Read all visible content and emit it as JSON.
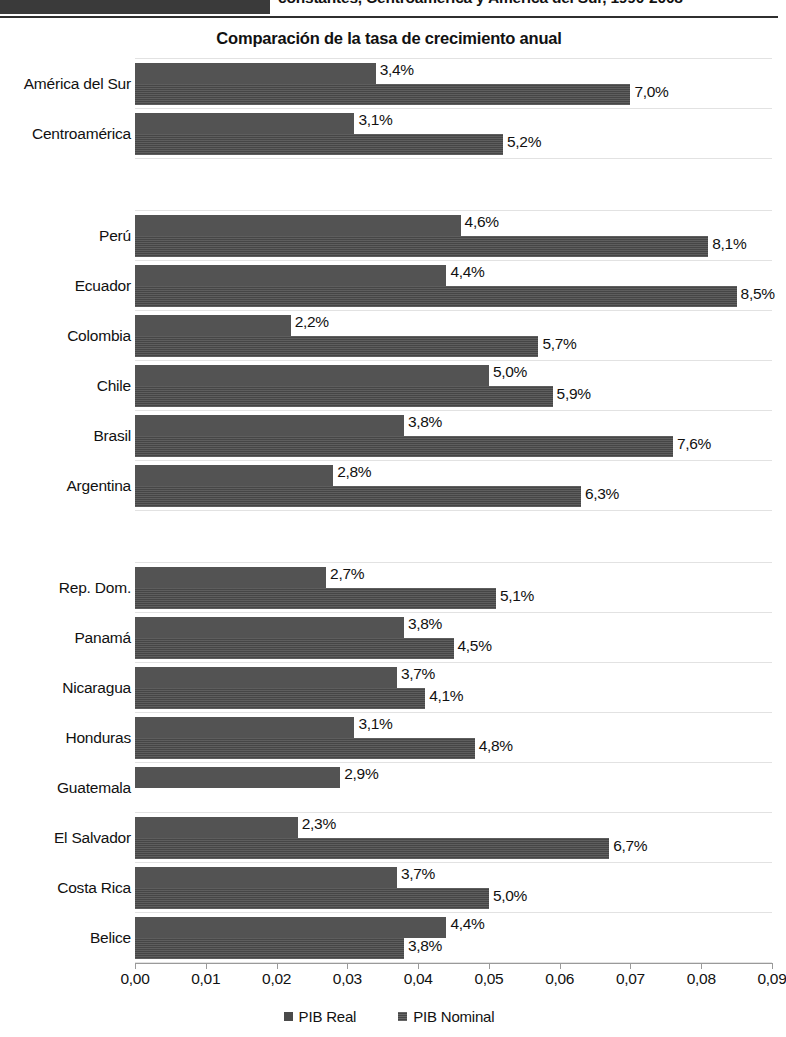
{
  "header": {
    "title_fragment": "constantes, Centroamérica y América del Sur, 1990-2008"
  },
  "subtitle": "Comparación de la tasa de crecimiento anual",
  "legend": {
    "items": [
      {
        "label": "PIB Real",
        "key": "real"
      },
      {
        "label": "PIB Nominal",
        "key": "nominal"
      }
    ]
  },
  "axis": {
    "tick_labels": [
      "0,00",
      "0,01",
      "0,02",
      "0,03",
      "0,04",
      "0,05",
      "0,06",
      "0,07",
      "0,08",
      "0,09"
    ],
    "min": 0.0,
    "max": 0.09
  },
  "chart_data": {
    "type": "bar",
    "orientation": "horizontal",
    "title": "Comparación de la tasa de crecimiento anual",
    "xlabel": "",
    "ylabel": "",
    "xlim": [
      0.0,
      0.09
    ],
    "grid": true,
    "legend_position": "bottom",
    "series": [
      {
        "name": "PIB Real",
        "key": "real"
      },
      {
        "name": "PIB Nominal",
        "key": "nominal"
      }
    ],
    "categories": [
      "América del Sur",
      "Centroamérica",
      "Perú",
      "Ecuador",
      "Colombia",
      "Chile",
      "Brasil",
      "Argentina",
      "Rep. Dom.",
      "Panamá",
      "Nicaragua",
      "Honduras",
      "Guatemala",
      "El Salvador",
      "Costa Rica",
      "Belice"
    ],
    "rows": [
      {
        "category": "América del Sur",
        "real": 0.034,
        "nominal": 0.07,
        "real_label": "3,4%",
        "nominal_label": "7,0%",
        "spacer_after": false
      },
      {
        "category": "Centroamérica",
        "real": 0.031,
        "nominal": 0.052,
        "real_label": "3,1%",
        "nominal_label": "5,2%",
        "spacer_after": true
      },
      {
        "category": "Perú",
        "real": 0.046,
        "nominal": 0.081,
        "real_label": "4,6%",
        "nominal_label": "8,1%",
        "spacer_after": false
      },
      {
        "category": "Ecuador",
        "real": 0.044,
        "nominal": 0.085,
        "real_label": "4,4%",
        "nominal_label": "8,5%",
        "spacer_after": false
      },
      {
        "category": "Colombia",
        "real": 0.022,
        "nominal": 0.057,
        "real_label": "2,2%",
        "nominal_label": "5,7%",
        "spacer_after": false
      },
      {
        "category": "Chile",
        "real": 0.05,
        "nominal": 0.059,
        "real_label": "5,0%",
        "nominal_label": "5,9%",
        "spacer_after": false
      },
      {
        "category": "Brasil",
        "real": 0.038,
        "nominal": 0.076,
        "real_label": "3,8%",
        "nominal_label": "7,6%",
        "spacer_after": false
      },
      {
        "category": "Argentina",
        "real": 0.028,
        "nominal": 0.063,
        "real_label": "2,8%",
        "nominal_label": "6,3%",
        "spacer_after": true
      },
      {
        "category": "Rep. Dom.",
        "real": 0.027,
        "nominal": 0.051,
        "real_label": "2,7%",
        "nominal_label": "5,1%",
        "spacer_after": false
      },
      {
        "category": "Panamá",
        "real": 0.038,
        "nominal": 0.045,
        "real_label": "3,8%",
        "nominal_label": "4,5%",
        "spacer_after": false
      },
      {
        "category": "Nicaragua",
        "real": 0.037,
        "nominal": 0.041,
        "real_label": "3,7%",
        "nominal_label": "4,1%",
        "spacer_after": false
      },
      {
        "category": "Honduras",
        "real": 0.031,
        "nominal": 0.048,
        "real_label": "3,1%",
        "nominal_label": "4,8%",
        "spacer_after": false
      },
      {
        "category": "Guatemala",
        "real": 0.029,
        "nominal": null,
        "real_label": "2,9%",
        "nominal_label": null,
        "spacer_after": false
      },
      {
        "category": "El Salvador",
        "real": 0.023,
        "nominal": 0.067,
        "real_label": "2,3%",
        "nominal_label": "6,7%",
        "spacer_after": false
      },
      {
        "category": "Costa Rica",
        "real": 0.037,
        "nominal": 0.05,
        "real_label": "3,7%",
        "nominal_label": "5,0%",
        "spacer_after": false
      },
      {
        "category": "Belice",
        "real": 0.044,
        "nominal": 0.038,
        "real_label": "4,4%",
        "nominal_label": "3,8%",
        "spacer_after": false
      }
    ]
  },
  "colors": {
    "bar_real": "#535353",
    "bar_nominal": "#464646",
    "gridline": "#e2e2e2",
    "text": "#111111"
  }
}
